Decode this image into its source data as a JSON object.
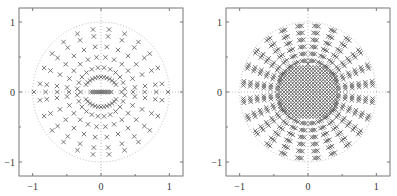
{
  "figure": {
    "panels": 2,
    "colors": {
      "frame": "#777777",
      "marker": "#555555",
      "guide": "#bbbbbb",
      "text": "#333333"
    }
  },
  "chart_data": [
    {
      "type": "scatter",
      "title": "",
      "xlabel": "",
      "ylabel": "",
      "xlim": [
        -1.2,
        1.2
      ],
      "ylim": [
        -1.2,
        1.2
      ],
      "xticks": [
        -1,
        0,
        1
      ],
      "yticks": [
        -1,
        0,
        1
      ],
      "xtick_labels": [
        "−1",
        "0",
        "1"
      ],
      "ytick_labels": [
        "−1",
        "0",
        "1"
      ],
      "grid": false,
      "guides": {
        "unit_circle": "dotted",
        "axes_lines": "dotted"
      },
      "marker": "x",
      "description": "Points arranged along radial rays from radius ~0.3 to ~1.0, plus two arcs near radius 0.25 above and below a dense row on the real axis",
      "pattern": {
        "rays": 24,
        "ray_radii": [
          0.35,
          0.5,
          0.65,
          0.8,
          0.9
        ],
        "inner_arc_radius": 0.26,
        "real_axis_row": [
          -0.15,
          0.15
        ]
      }
    },
    {
      "type": "scatter",
      "title": "",
      "xlabel": "",
      "ylabel": "",
      "xlim": [
        -1.2,
        1.2
      ],
      "ylim": [
        -1.2,
        1.2
      ],
      "xticks": [
        -1,
        0,
        1
      ],
      "yticks": [
        -1,
        0,
        1
      ],
      "xtick_labels": [
        "−1",
        "0",
        "1"
      ],
      "ytick_labels": [
        "−1",
        "0",
        "1"
      ],
      "grid": false,
      "guides": {
        "unit_circle": "dotted",
        "axes_lines": "dotted"
      },
      "marker": "x",
      "description": "Dense clusters of points along radial rays filling the disk of radius ~1, very dense central blob within radius ~0.4",
      "pattern": {
        "rays": 24,
        "ray_radii": [
          0.45,
          0.55,
          0.65,
          0.75,
          0.85,
          0.95
        ],
        "central_cluster_radius": 0.4
      }
    }
  ]
}
